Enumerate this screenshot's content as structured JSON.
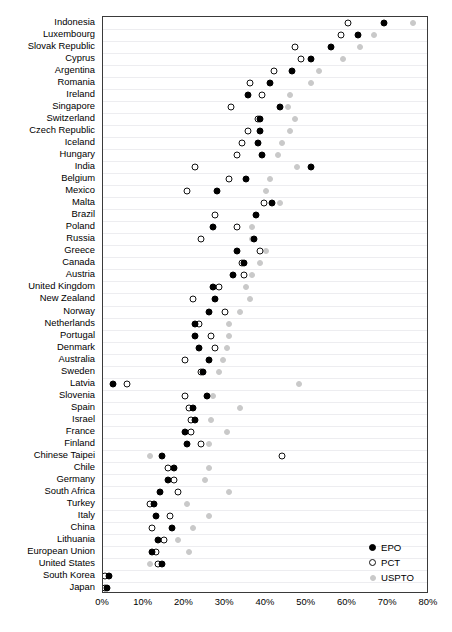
{
  "chart_data": {
    "type": "scatter",
    "title": "",
    "xlabel": "",
    "ylabel": "",
    "xlim": [
      0,
      80
    ],
    "xticks": [
      0,
      10,
      20,
      30,
      40,
      50,
      60,
      70,
      80
    ],
    "xtick_labels": [
      "0%",
      "10%",
      "20%",
      "30%",
      "40%",
      "50%",
      "60%",
      "70%",
      "80%"
    ],
    "grid": true,
    "legend_position": "bottom-right",
    "legend": [
      {
        "name": "EPO",
        "marker": "filled-circle",
        "color": "#000000"
      },
      {
        "name": "PCT",
        "marker": "open-circle",
        "color": "#ffffff"
      },
      {
        "name": "USPTO",
        "marker": "filled-circle",
        "color": "#c9c9c9"
      }
    ],
    "series_names": [
      "EPO",
      "PCT",
      "USPTO"
    ],
    "categories": [
      "Indonesia",
      "Luxembourg",
      "Slovak Republic",
      "Cyprus",
      "Argentina",
      "Romania",
      "Ireland",
      "Singapore",
      "Switzerland",
      "Czech Republic",
      "Iceland",
      "Hungary",
      "India",
      "Belgium",
      "Mexico",
      "Malta",
      "Brazil",
      "Poland",
      "Russia",
      "Greece",
      "Canada",
      "Austria",
      "United Kingdom",
      "New Zealand",
      "Norway",
      "Netherlands",
      "Portugal",
      "Denmark",
      "Australia",
      "Sweden",
      "Latvia",
      "Slovenia",
      "Spain",
      "Israel",
      "France",
      "Finland",
      "Chinese Taipei",
      "Chile",
      "Germany",
      "South Africa",
      "Turkey",
      "Italy",
      "China",
      "Lithuania",
      "European Union",
      "United States",
      "South Korea",
      "Japan"
    ],
    "series": [
      {
        "name": "EPO",
        "values": [
          69.0,
          62.5,
          56.0,
          51.0,
          46.5,
          41.0,
          35.5,
          43.5,
          38.5,
          38.5,
          38.0,
          39.0,
          51.0,
          35.0,
          28.0,
          41.5,
          37.5,
          27.0,
          37.0,
          33.0,
          34.5,
          32.0,
          27.0,
          27.5,
          26.0,
          22.5,
          22.5,
          23.5,
          26.0,
          24.5,
          2.5,
          25.5,
          22.0,
          22.5,
          20.0,
          20.5,
          14.5,
          17.5,
          16.0,
          14.0,
          12.5,
          13.0,
          17.0,
          13.5,
          12.0,
          14.5,
          1.5,
          1.0
        ]
      },
      {
        "name": "PCT",
        "values": [
          60.0,
          58.5,
          47.0,
          48.5,
          42.0,
          36.0,
          39.0,
          31.5,
          38.0,
          35.5,
          34.0,
          33.0,
          22.5,
          31.0,
          20.5,
          39.5,
          27.5,
          33.0,
          24.0,
          38.5,
          34.0,
          34.5,
          28.5,
          22.0,
          30.0,
          23.5,
          26.5,
          27.5,
          20.0,
          24.0,
          6.0,
          20.0,
          21.0,
          21.5,
          21.5,
          24.0,
          44.0,
          16.0,
          17.5,
          18.5,
          11.5,
          16.5,
          12.0,
          15.0,
          13.0,
          13.5,
          0.5,
          0.5
        ]
      },
      {
        "name": "USPTO",
        "values": [
          76.0,
          66.5,
          63.0,
          59.0,
          53.0,
          51.0,
          46.0,
          45.5,
          47.0,
          46.0,
          44.0,
          43.0,
          47.5,
          41.0,
          40.0,
          43.5,
          37.5,
          36.5,
          36.5,
          40.0,
          38.5,
          36.5,
          35.0,
          36.0,
          33.5,
          31.0,
          31.0,
          30.5,
          29.5,
          28.5,
          48.0,
          27.0,
          33.5,
          26.5,
          30.5,
          26.0,
          11.5,
          26.0,
          25.0,
          31.0,
          20.5,
          26.0,
          22.0,
          18.5,
          21.0,
          11.5,
          1.5,
          1.0
        ]
      }
    ]
  },
  "legend_labels": {
    "epo": "EPO",
    "pct": "PCT",
    "uspto": "USPTO"
  },
  "caption": ""
}
